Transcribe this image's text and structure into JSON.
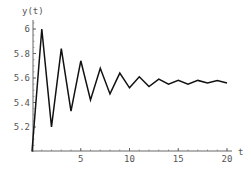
{
  "chart_data": {
    "type": "line",
    "title": "",
    "xlabel": "t",
    "ylabel": "y(t)",
    "xlim": [
      0,
      20.5
    ],
    "ylim": [
      5.0,
      6.05
    ],
    "grid": false,
    "legend": null,
    "x_ticks": [
      5,
      10,
      15,
      20
    ],
    "x_tick_labels": [
      "5",
      "10",
      "15",
      "20"
    ],
    "y_ticks": [
      5.2,
      5.4,
      5.6,
      5.8,
      6.0
    ],
    "y_tick_labels": [
      "5.2",
      "5.4",
      "5.6",
      "5.8",
      "6"
    ],
    "series": [
      {
        "name": "y(t)",
        "color": "#111111",
        "x": [
          0,
          1,
          2,
          3,
          4,
          5,
          6,
          7,
          8,
          9,
          10,
          11,
          12,
          13,
          14,
          15,
          16,
          17,
          18,
          19,
          20
        ],
        "values": [
          5.0,
          6.0,
          5.2,
          5.84,
          5.33,
          5.74,
          5.42,
          5.68,
          5.47,
          5.64,
          5.52,
          5.61,
          5.53,
          5.59,
          5.55,
          5.58,
          5.55,
          5.58,
          5.56,
          5.58,
          5.56
        ]
      }
    ]
  },
  "labels": {
    "y_axis": "y(t)",
    "x_axis": "t"
  },
  "colors": {
    "line": "#111111",
    "axis": "#666666",
    "text": "#555555"
  }
}
